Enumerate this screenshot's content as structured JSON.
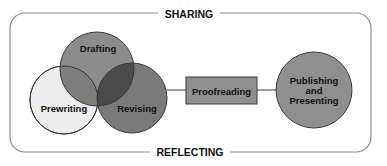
{
  "diagram": {
    "type": "writing-process",
    "frame": {
      "top_label": "SHARING",
      "bottom_label": "REFLECTING"
    },
    "stages": [
      {
        "id": "prewriting",
        "label": "Prewriting",
        "shape": "circle",
        "fill": "#ececec"
      },
      {
        "id": "drafting",
        "label": "Drafting",
        "shape": "circle",
        "fill": "#8c8c8c"
      },
      {
        "id": "revising",
        "label": "Revising",
        "shape": "circle",
        "fill": "#7a7a7a"
      },
      {
        "id": "proofreading",
        "label": "Proofreading",
        "shape": "rect",
        "fill": "#8f8f8f"
      },
      {
        "id": "publishing",
        "label_lines": [
          "Publishing",
          "and",
          "Presenting"
        ],
        "shape": "circle",
        "fill": "#8f8f8f"
      }
    ],
    "colors": {
      "stroke": "#3a3a3a",
      "frame": "#8a8a8a",
      "overlap_dark": "#4a4a4a",
      "overlap_darkest": "#383838"
    }
  }
}
